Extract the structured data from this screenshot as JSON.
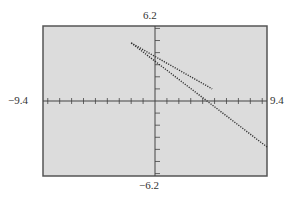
{
  "chart_data": {
    "type": "line",
    "title": "",
    "xlabel": "",
    "ylabel": "",
    "window": {
      "xmin": -9.4,
      "xmax": 9.4,
      "ymin": -6.2,
      "ymax": 6.2
    },
    "xlim": [
      -9.4,
      9.4
    ],
    "ylim": [
      -6.2,
      6.2
    ],
    "xscl": 1,
    "yscl": 1,
    "grid": false,
    "style": "dotted",
    "labels": {
      "ymax": "6.2",
      "ymin": "−6.2",
      "xmin": "−9.4",
      "xmax": "9.4"
    },
    "series": [
      {
        "name": "shorter-line",
        "points": [
          [
            -2.0,
            4.8
          ],
          [
            4.8,
            1.0
          ]
        ]
      },
      {
        "name": "longer-line",
        "points": [
          [
            -2.0,
            4.8
          ],
          [
            9.4,
            -3.8
          ]
        ]
      }
    ],
    "colors": {
      "background": "#dcdcdc",
      "frame": "#555555",
      "axes": "#444444",
      "lines": "#333333"
    }
  }
}
